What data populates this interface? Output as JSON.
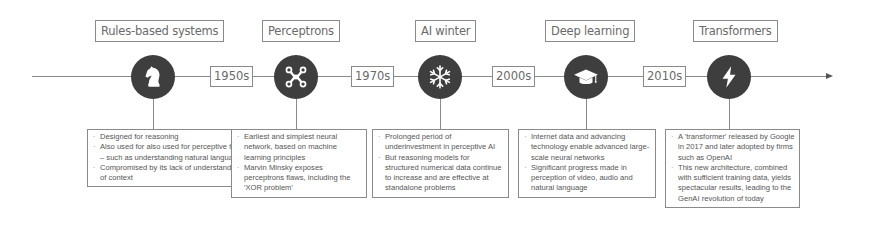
{
  "timeline": {
    "axis_color": "#8a8a8a",
    "node_color": "#3e3e3e",
    "stages": [
      {
        "title": "Rules-based systems",
        "icon": "chess-knight-icon",
        "bullets": [
          "Designed for reasoning",
          "Also used for also used for perceptive tasks – such as understanding natural language",
          "Compromised by its lack of understanding of context"
        ]
      },
      {
        "title": "Perceptrons",
        "icon": "neural-network-icon",
        "bullets": [
          "Earliest and simplest neural network, based on machine learning principles",
          "Marvin Minsky exposes perceptrons flaws, including the 'XOR problem'"
        ]
      },
      {
        "title": "AI winter",
        "icon": "snowflake-icon",
        "bullets": [
          "Prolonged period of underinvestment in perceptive AI",
          "But reasoning models for structured numerical data continue to increase and are effective at standalone problems"
        ]
      },
      {
        "title": "Deep learning",
        "icon": "graduation-cap-icon",
        "bullets": [
          "Internet data and advancing technology enable advanced large-scale neural networks",
          "Significant progress made in perception of video, audio and natural language"
        ]
      },
      {
        "title": "Transformers",
        "icon": "lightning-bolt-icon",
        "bullets": [
          "A 'transformer' released by Google in 2017 and later adopted by firms such as OpenAI",
          "This new architecture, combined with sufficient training data, yields spectacular results, leading to the GenAI revolution of today"
        ]
      }
    ],
    "eras": [
      "1950s",
      "1970s",
      "2000s",
      "2010s"
    ]
  }
}
